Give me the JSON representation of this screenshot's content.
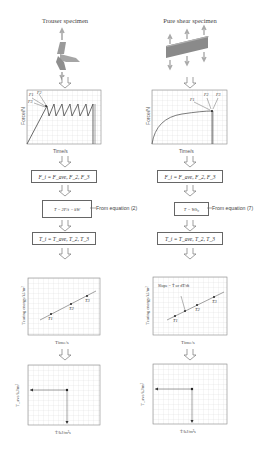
{
  "left_column": {
    "title": "Trouser specimen",
    "force_chart": {
      "ylabel": "Force/N",
      "xlabel": "Time/s",
      "annotations": [
        "F1",
        "F2",
        "F3"
      ]
    },
    "force_box": "F_i = F_ave, F_2, F_3",
    "energy_box": "T = 2F/t − kW",
    "energy_note": "From equation (2)",
    "tearing_box": "T_i = T_ave, T_2, T_3",
    "tearing_chart": {
      "ylabel": "Tearing energy/kJ/m²",
      "xlabel": "Time/s",
      "points": [
        "T1",
        "T2",
        "T3"
      ]
    },
    "final_chart": {
      "ylabel": "T_ave/kJ/m²",
      "xlabel": "Ṫ/kJ/m²s"
    }
  },
  "right_column": {
    "title": "Pure shear specimen",
    "force_chart": {
      "ylabel": "Force/N",
      "xlabel": "Time/s",
      "annotations": [
        "F1",
        "F2",
        "F3"
      ]
    },
    "force_box": "F_i = F_ave, F_2, F_3",
    "energy_box": "T = Wh₀",
    "energy_note": "From equation (7)",
    "tearing_box": "T_i = T_ave, T_2, T_3",
    "tearing_chart": {
      "ylabel": "Tearing energy/kJ/m²",
      "xlabel": "Time/s",
      "points": [
        "T1",
        "T2",
        "T3"
      ],
      "slope_label": "Slope = Ṫ or dT/dt"
    },
    "final_chart": {
      "ylabel": "T_ave/kJ/m²",
      "xlabel": "Ṫ/kJ/m²s"
    }
  },
  "colors": {
    "grid": "#d4d4d4",
    "frame": "#888888",
    "specimen": "#9a9a9a",
    "line": "#444444"
  }
}
